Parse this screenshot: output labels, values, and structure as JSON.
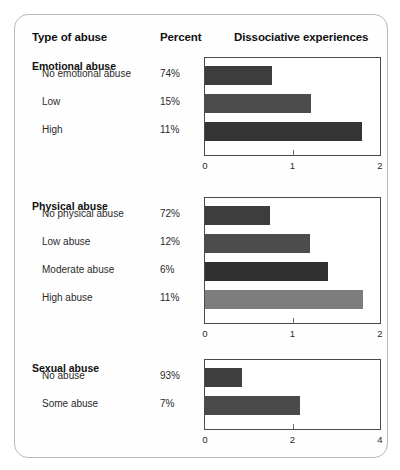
{
  "header": {
    "col_type": "Type of abuse",
    "col_percent": "Percent",
    "col_chart": "Dissociative experiences"
  },
  "chart_data": {
    "type": "bar",
    "orientation": "horizontal",
    "title": "Dissociative experiences",
    "xlabel": "",
    "ylabel": "",
    "panels": [
      {
        "title": "Emotional abuse",
        "xlim": [
          0,
          2
        ],
        "xticks": [
          0,
          1,
          2
        ],
        "xticklabels": [
          "0",
          "1",
          "2"
        ],
        "categories": [
          "No emotional abuse",
          "Low",
          "High"
        ],
        "percents": [
          "74%",
          "15%",
          "11%"
        ],
        "values": [
          0.77,
          1.21,
          1.79
        ],
        "colors": [
          "#3d3d3d",
          "#4c4c4c",
          "#343434"
        ]
      },
      {
        "title": "Physical abuse",
        "xlim": [
          0,
          2
        ],
        "xticks": [
          0,
          1,
          2
        ],
        "xticklabels": [
          "0",
          "1",
          "2"
        ],
        "categories": [
          "No physical abuse",
          "Low abuse",
          "Moderate abuse",
          "High abuse"
        ],
        "percents": [
          "72%",
          "12%",
          "6%",
          "11%"
        ],
        "values": [
          0.74,
          1.2,
          1.41,
          1.81
        ],
        "colors": [
          "#3d3d3d",
          "#4c4c4c",
          "#303030",
          "#7d7d7d"
        ]
      },
      {
        "title": "Sexual abuse",
        "xlim": [
          0,
          4
        ],
        "xticks": [
          0,
          2,
          4
        ],
        "xticklabels": [
          "0",
          "2",
          "4"
        ],
        "categories": [
          "No abuse",
          "Some abuse"
        ],
        "percents": [
          "93%",
          "7%"
        ],
        "values": [
          0.84,
          2.16
        ],
        "colors": [
          "#3f3f3f",
          "#4a4a4a"
        ]
      }
    ]
  }
}
